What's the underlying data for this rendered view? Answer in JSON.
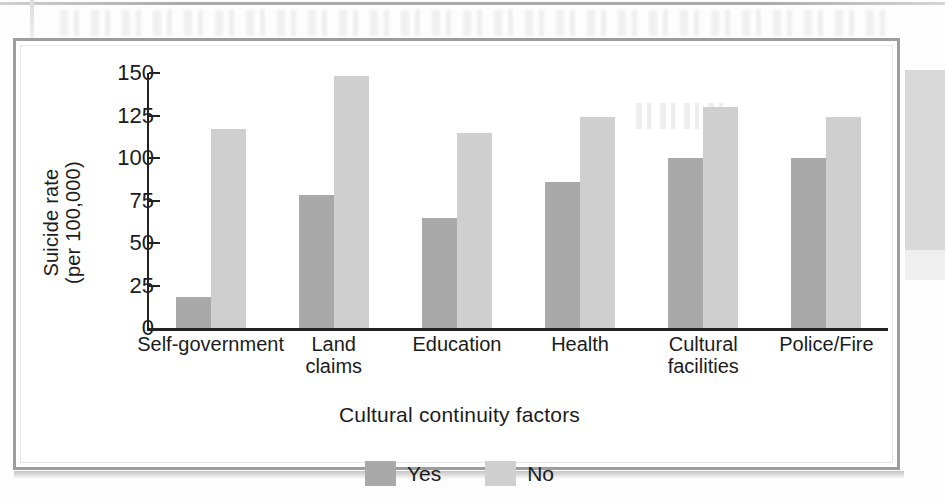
{
  "chart_data": {
    "type": "bar",
    "title": "",
    "xlabel": "Cultural continuity factors",
    "ylabel": "Suicide rate\n(per 100,000)",
    "ylabel_line1": "Suicide rate",
    "ylabel_line2": "(per 100,000)",
    "categories": [
      "Self-government",
      "Land\nclaims",
      "Education",
      "Health",
      "Cultural\nfacilities",
      "Police/Fire"
    ],
    "series": [
      {
        "name": "Yes",
        "color": "#a9a9a9",
        "values": [
          18,
          78,
          65,
          86,
          100,
          100
        ]
      },
      {
        "name": "No",
        "color": "#cfcfcf",
        "values": [
          117,
          148,
          115,
          124,
          130,
          124
        ]
      }
    ],
    "yticks": [
      0,
      25,
      50,
      75,
      100,
      125,
      150
    ],
    "ytick_labels": [
      "0",
      "25",
      "50",
      "75",
      "100",
      "125",
      "150"
    ],
    "ylim": [
      0,
      150
    ],
    "grid": false,
    "legend_position": "bottom-center"
  },
  "legend": {
    "items": [
      {
        "label": "Yes",
        "color": "#a9a9a9"
      },
      {
        "label": "No",
        "color": "#cfcfcf"
      }
    ]
  }
}
